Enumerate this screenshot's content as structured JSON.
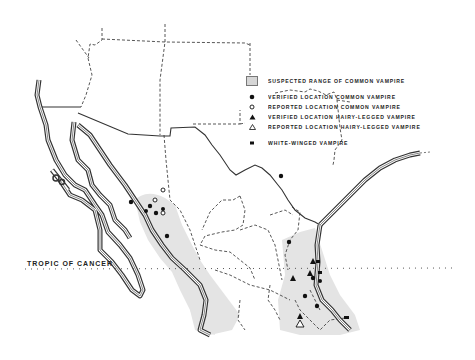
{
  "legend": {
    "items": [
      {
        "symbol": "range-swatch",
        "label": "SUSPECTED RANGE OF COMMON VAMPIRE"
      },
      {
        "symbol": "filled-circle",
        "label": "VERIFIED LOCATION COMMON VAMPIRE"
      },
      {
        "symbol": "open-circle",
        "label": "REPORTED LOCATION COMMON VAMPIRE"
      },
      {
        "symbol": "filled-triangle",
        "label": "VERIFIED LOCATION HAIRY-LEGGED VAMPIRE"
      },
      {
        "symbol": "open-triangle",
        "label": "REPORTED LOCATION HAIRY-LEGGED VAMPIRE"
      },
      {
        "symbol": "filled-square",
        "label": "WHITE-WINGED VAMPIRE"
      }
    ]
  },
  "annotations": {
    "tropic_label": "TROPIC OF CANCER"
  },
  "colors": {
    "range_fill": "#e2e2e2",
    "ink": "#222222",
    "background": "#ffffff"
  },
  "points": {
    "verified_common": [
      [
        131,
        202
      ],
      [
        150,
        206
      ],
      [
        156,
        213
      ],
      [
        167,
        236
      ],
      [
        317,
        240
      ],
      [
        305,
        262
      ],
      [
        313,
        278
      ],
      [
        305,
        296
      ],
      [
        317,
        306
      ],
      [
        289,
        271
      ]
    ],
    "reported_common": [
      [
        143,
        188
      ],
      [
        154,
        199
      ],
      [
        165,
        190
      ]
    ],
    "verified_hairy_legged": [
      [
        312,
        263
      ],
      [
        310,
        273
      ],
      [
        292,
        280
      ],
      [
        300,
        317
      ]
    ],
    "reported_hairy_legged": [
      [
        300,
        324
      ]
    ],
    "white_winged": [
      [
        279,
        290
      ],
      [
        345,
        318
      ],
      [
        281,
        176
      ],
      [
        318,
        250
      ]
    ]
  }
}
